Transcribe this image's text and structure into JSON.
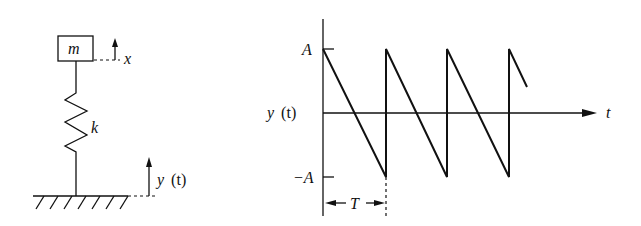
{
  "system": {
    "mass_label": "m",
    "spring_label": "k",
    "response_label": "x",
    "base_label_var": "y",
    "base_label_arg": "(t)"
  },
  "graph": {
    "y_axis_label_var": "y",
    "y_axis_label_arg": "(t)",
    "x_axis_label": "t",
    "upper_tick_label": "A",
    "lower_tick_label": "−A",
    "period_label": "T",
    "waveform": "sawtooth",
    "cycles_shown": 3.3
  }
}
